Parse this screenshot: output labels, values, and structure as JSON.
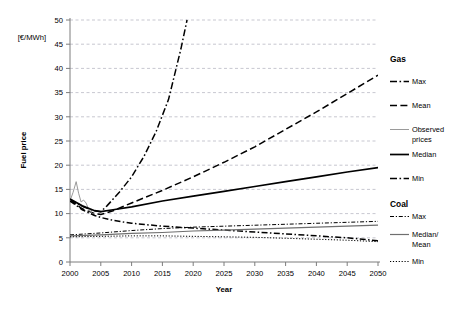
{
  "chart_data": {
    "type": "line",
    "title": "",
    "xlabel": "Year",
    "ylabel": "Fuel price",
    "units": "[€/MWh]",
    "xlim": [
      2000,
      2050
    ],
    "ylim": [
      0,
      50
    ],
    "xticks": [
      2000,
      2005,
      2010,
      2015,
      2020,
      2025,
      2030,
      2035,
      2040,
      2045,
      2050
    ],
    "yticks": [
      0,
      5,
      10,
      15,
      20,
      25,
      30,
      35,
      40,
      45,
      50
    ],
    "grid": true,
    "legend_position": "right",
    "series": [
      {
        "name": "Gas Max",
        "group": "Gas",
        "style": "dash-dot",
        "color": "#000000",
        "x": [
          2000,
          2001,
          2002,
          2003,
          2004,
          2005,
          2006,
          2008,
          2010,
          2012,
          2014,
          2016,
          2018,
          2019
        ],
        "values": [
          13.0,
          12.2,
          11.5,
          11.0,
          10.6,
          10.4,
          11.6,
          14.4,
          17.6,
          21.8,
          27.0,
          33.6,
          44.0,
          50.0
        ]
      },
      {
        "name": "Gas Mean",
        "group": "Gas",
        "style": "dashed",
        "color": "#000000",
        "x": [
          2000,
          2002,
          2004,
          2005,
          2007,
          2010,
          2015,
          2020,
          2025,
          2030,
          2035,
          2040,
          2045,
          2050
        ],
        "values": [
          12.8,
          11.0,
          10.0,
          9.8,
          10.6,
          12.2,
          14.8,
          17.6,
          20.6,
          23.8,
          27.4,
          31.0,
          34.8,
          38.6
        ]
      },
      {
        "name": "Gas Observed prices",
        "group": "Gas",
        "style": "solid-thin",
        "color": "#9a9a9a",
        "x": [
          2000,
          2000.5,
          2001,
          2001.4,
          2001.8,
          2002.2,
          2002.6,
          2003,
          2003.4,
          2004
        ],
        "values": [
          12.6,
          14.4,
          16.6,
          14.2,
          12.4,
          12.8,
          12.2,
          11.0,
          10.2,
          9.8
        ]
      },
      {
        "name": "Gas Median",
        "group": "Gas",
        "style": "solid",
        "color": "#000000",
        "x": [
          2000,
          2002,
          2004,
          2005,
          2007,
          2010,
          2015,
          2020,
          2025,
          2030,
          2035,
          2040,
          2045,
          2050
        ],
        "values": [
          13.0,
          11.6,
          10.6,
          10.4,
          10.8,
          11.4,
          12.6,
          13.6,
          14.6,
          15.6,
          16.6,
          17.6,
          18.6,
          19.5
        ]
      },
      {
        "name": "Gas Min",
        "group": "Gas",
        "style": "dash-dot",
        "color": "#000000",
        "x": [
          2000,
          2002,
          2004,
          2005,
          2007,
          2010,
          2015,
          2020,
          2025,
          2030,
          2035,
          2040,
          2045,
          2050
        ],
        "values": [
          12.6,
          10.8,
          9.6,
          9.2,
          8.6,
          8.0,
          7.4,
          7.0,
          6.6,
          6.2,
          5.8,
          5.4,
          5.0,
          4.4
        ]
      },
      {
        "name": "Coal Max",
        "group": "Coal",
        "style": "dash-dot",
        "color": "#000000",
        "x": [
          2000,
          2005,
          2010,
          2015,
          2020,
          2025,
          2030,
          2035,
          2040,
          2045,
          2050
        ],
        "values": [
          5.6,
          6.0,
          6.5,
          6.9,
          7.2,
          7.4,
          7.6,
          7.8,
          8.0,
          8.2,
          8.4
        ]
      },
      {
        "name": "Coal Median/Mean",
        "group": "Coal",
        "style": "solid",
        "color": "#6f6f6f",
        "x": [
          2000,
          2005,
          2010,
          2015,
          2020,
          2025,
          2030,
          2035,
          2040,
          2045,
          2050
        ],
        "values": [
          5.4,
          5.6,
          5.9,
          6.1,
          6.4,
          6.6,
          6.8,
          7.0,
          7.2,
          7.4,
          7.6
        ]
      },
      {
        "name": "Coal Min",
        "group": "Coal",
        "style": "dotted",
        "color": "#000000",
        "x": [
          2000,
          2005,
          2010,
          2015,
          2020,
          2025,
          2030,
          2035,
          2040,
          2045,
          2050
        ],
        "values": [
          5.2,
          5.3,
          5.4,
          5.4,
          5.3,
          5.2,
          5.1,
          4.9,
          4.7,
          4.5,
          4.2
        ]
      }
    ]
  },
  "legend": {
    "groups": [
      {
        "heading": "Gas",
        "entries": [
          {
            "label": "Max",
            "swatch": "dash-dot"
          },
          {
            "label": "Mean",
            "swatch": "dashed"
          },
          {
            "label": "Observed prices",
            "swatch": "solid-thin"
          },
          {
            "label": "Median",
            "swatch": "solid"
          },
          {
            "label": "Min",
            "swatch": "dash-dot"
          }
        ]
      },
      {
        "heading": "Coal",
        "entries": [
          {
            "label": "Max",
            "swatch": "dash-dot-thin"
          },
          {
            "label": "Median/ Mean",
            "swatch": "solid-gray"
          },
          {
            "label": "Min",
            "swatch": "dotted"
          }
        ]
      }
    ]
  },
  "axes": {
    "y_title": "Fuel price",
    "y_units": "[€/MWh]",
    "x_title": "Year",
    "yticks": [
      "0",
      "5",
      "10",
      "15",
      "20",
      "25",
      "30",
      "35",
      "40",
      "45",
      "50"
    ],
    "xticks": [
      "2000",
      "2005",
      "2010",
      "2015",
      "2020",
      "2025",
      "2030",
      "2035",
      "2040",
      "2045",
      "2050"
    ]
  }
}
